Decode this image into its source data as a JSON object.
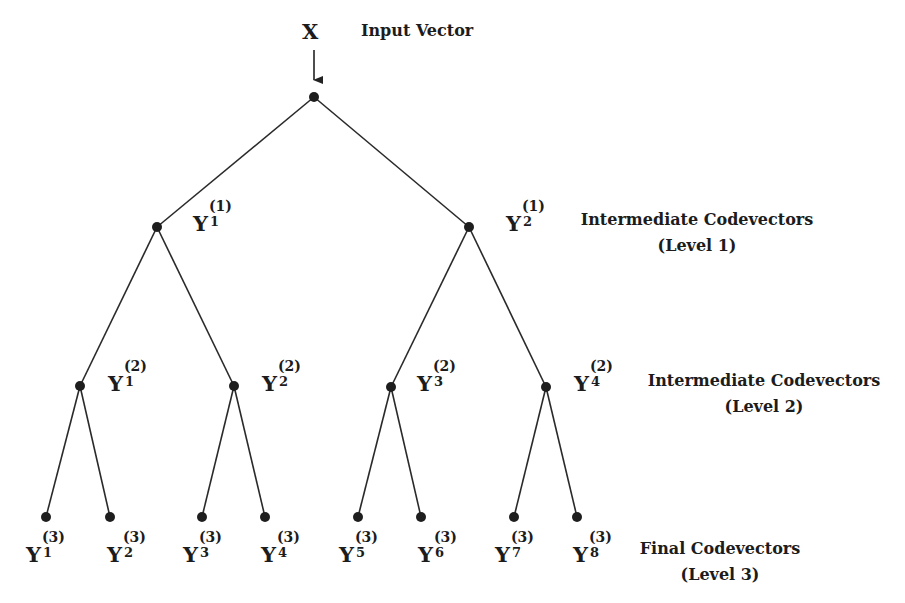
{
  "diagram": {
    "type": "tree-structured vector quantizer",
    "input": {
      "symbol": "X",
      "label": "Input Vector"
    },
    "level_labels": [
      {
        "line1": "Intermediate Codevectors",
        "line2": "(Level 1)"
      },
      {
        "line1": "Intermediate Codevectors",
        "line2": "(Level 2)"
      },
      {
        "line1": "Final Codevectors",
        "line2": "(Level 3)"
      }
    ],
    "levels": [
      {
        "level": "1",
        "nodes": [
          {
            "base": "Y",
            "sub": "1",
            "sup": "(1)"
          },
          {
            "base": "Y",
            "sub": "2",
            "sup": "(1)"
          }
        ]
      },
      {
        "level": "2",
        "nodes": [
          {
            "base": "Y",
            "sub": "1",
            "sup": "(2)"
          },
          {
            "base": "Y",
            "sub": "2",
            "sup": "(2)"
          },
          {
            "base": "Y",
            "sub": "3",
            "sup": "(2)"
          },
          {
            "base": "Y",
            "sub": "4",
            "sup": "(2)"
          }
        ]
      },
      {
        "level": "3",
        "nodes": [
          {
            "base": "Y",
            "sub": "1",
            "sup": "(3)"
          },
          {
            "base": "Y",
            "sub": "2",
            "sup": "(3)"
          },
          {
            "base": "Y",
            "sub": "3",
            "sup": "(3)"
          },
          {
            "base": "Y",
            "sub": "4",
            "sup": "(3)"
          },
          {
            "base": "Y",
            "sub": "5",
            "sup": "(3)"
          },
          {
            "base": "Y",
            "sub": "6",
            "sup": "(3)"
          },
          {
            "base": "Y",
            "sub": "7",
            "sup": "(3)"
          },
          {
            "base": "Y",
            "sub": "8",
            "sup": "(3)"
          }
        ]
      }
    ]
  }
}
